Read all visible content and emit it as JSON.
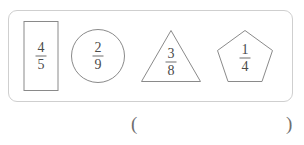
{
  "panel": {
    "name": "fraction-shapes-panel",
    "border_color": "#cfcfcf",
    "shape_stroke_color": "#8a8a8a",
    "text_color": "#4a4a4a",
    "shapes": [
      {
        "shape": "rectangle",
        "numerator": "4",
        "denominator": "5",
        "fraction": "4/5"
      },
      {
        "shape": "circle",
        "numerator": "2",
        "denominator": "9",
        "fraction": "2/9"
      },
      {
        "shape": "triangle",
        "numerator": "3",
        "denominator": "8",
        "fraction": "3/8"
      },
      {
        "shape": "pentagon",
        "numerator": "1",
        "denominator": "4",
        "fraction": "1/4"
      }
    ]
  },
  "answer": {
    "open_paren": "(",
    "close_paren": ")",
    "value": ""
  }
}
